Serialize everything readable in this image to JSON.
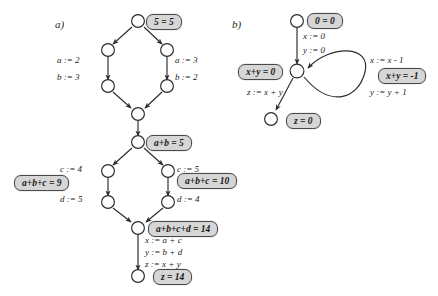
{
  "figure": {
    "panels": [
      {
        "id": "panel-a",
        "label": "a)",
        "assertions": [
          {
            "id": "a-root",
            "text": "5 = 5"
          },
          {
            "id": "a-join1",
            "text": "a+b = 5"
          },
          {
            "id": "a-left-abc",
            "text": "a+b+c = 9"
          },
          {
            "id": "a-right-abc",
            "text": "a+b+c = 10"
          },
          {
            "id": "a-join2",
            "text": "a+b+c+d = 14"
          },
          {
            "id": "a-final",
            "text": "z = 14"
          }
        ],
        "assignments": [
          {
            "id": "a-left-a",
            "text": "a := 2"
          },
          {
            "id": "a-left-b",
            "text": "b := 3"
          },
          {
            "id": "a-right-a",
            "text": "a := 3"
          },
          {
            "id": "a-right-b",
            "text": "b := 2"
          },
          {
            "id": "a-left-c",
            "text": "c := 4"
          },
          {
            "id": "a-left-d",
            "text": "d := 5"
          },
          {
            "id": "a-right-c",
            "text": "c := 5"
          },
          {
            "id": "a-right-d",
            "text": "d := 4"
          },
          {
            "id": "a-x",
            "text": "x := a + c"
          },
          {
            "id": "a-y",
            "text": "y := b + d"
          },
          {
            "id": "a-z",
            "text": "z := x + y"
          }
        ]
      },
      {
        "id": "panel-b",
        "label": "b)",
        "assertions": [
          {
            "id": "b-root",
            "text": "0 = 0"
          },
          {
            "id": "b-loop",
            "text": "x+y = 0"
          },
          {
            "id": "b-inv",
            "text": "x+y = -1"
          },
          {
            "id": "b-final",
            "text": "z = 0"
          }
        ],
        "assignments": [
          {
            "id": "b-x0",
            "text": "x := 0"
          },
          {
            "id": "b-y0",
            "text": "y := 0"
          },
          {
            "id": "b-zxy",
            "text": "z := x + y"
          },
          {
            "id": "b-xdec",
            "text": "x := x - 1"
          },
          {
            "id": "b-yinc",
            "text": "y := y + 1"
          }
        ]
      }
    ],
    "colors": {
      "box_fill": "#d6d6d6",
      "box_border": "#4a4a4a",
      "edge": "#2b2b2b",
      "node_fill": "#ffffff",
      "node_border": "#2b2b2b",
      "background": "#ffffff"
    }
  }
}
